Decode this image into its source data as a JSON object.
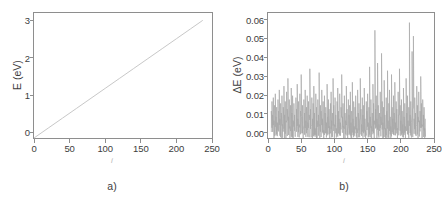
{
  "figure": {
    "caption_a": "a)",
    "caption_b": "b)",
    "line_color": "#c8c8c8",
    "spike_color": "#a8a8a8",
    "axis_color": "#8e8e8e"
  },
  "panel_a": {
    "ylabel": "E (eV)",
    "xlabel": "i",
    "caption": "a)",
    "yticks": [
      "0",
      "1",
      "2",
      "3"
    ],
    "xticks": [
      "0",
      "50",
      "100",
      "150",
      "200",
      "250"
    ]
  },
  "panel_b": {
    "ylabel": "ΔE  (eV)",
    "xlabel": "i",
    "caption": "b)",
    "yticks": [
      "0.00",
      "0.01",
      "0.02",
      "0.03",
      "0.04",
      "0.05",
      "0.06"
    ],
    "xticks": [
      "0",
      "50",
      "100",
      "150",
      "200",
      "250"
    ]
  },
  "chart_data": [
    {
      "type": "line",
      "panel": "a",
      "title": "",
      "xlabel": "i",
      "ylabel": "E (eV)",
      "xlim": [
        0,
        250
      ],
      "ylim": [
        0,
        3.4
      ],
      "xticks": [
        0,
        50,
        100,
        150,
        200,
        250
      ],
      "yticks": [
        0,
        1,
        2,
        3
      ],
      "grid": false,
      "legend": null,
      "series": [
        {
          "name": "E(i)",
          "description": "linear ramp of eigenvalue energy versus index i",
          "x": [
            0,
            20,
            40,
            60,
            80,
            100,
            120,
            140,
            160,
            180,
            200,
            220,
            237
          ],
          "y": [
            0.0,
            0.27,
            0.54,
            0.81,
            1.08,
            1.35,
            1.62,
            1.89,
            2.16,
            2.43,
            2.7,
            2.97,
            3.2
          ]
        }
      ]
    },
    {
      "type": "line",
      "panel": "b",
      "title": "",
      "xlabel": "i",
      "ylabel": "ΔE (eV)",
      "xlim": [
        0,
        250
      ],
      "ylim": [
        0,
        0.065
      ],
      "xticks": [
        0,
        50,
        100,
        150,
        200,
        250
      ],
      "yticks": [
        0.0,
        0.01,
        0.02,
        0.03,
        0.04,
        0.05,
        0.06
      ],
      "grid": false,
      "legend": null,
      "series": [
        {
          "name": "ΔE(i)",
          "description": "level spacing fluctuations versus index i, dense noisy spikes",
          "x": [
            5,
            6,
            7,
            8,
            9,
            10,
            11,
            12,
            13,
            14,
            15,
            16,
            17,
            18,
            19,
            20,
            21,
            22,
            23,
            24,
            25,
            26,
            27,
            28,
            29,
            30,
            31,
            32,
            33,
            34,
            35,
            36,
            37,
            38,
            39,
            40,
            41,
            42,
            43,
            44,
            45,
            46,
            47,
            48,
            49,
            50,
            51,
            52,
            53,
            54,
            55,
            56,
            57,
            58,
            59,
            60,
            61,
            62,
            63,
            64,
            65,
            66,
            67,
            68,
            69,
            70,
            71,
            72,
            73,
            74,
            75,
            76,
            77,
            78,
            79,
            80,
            81,
            82,
            83,
            84,
            85,
            86,
            87,
            88,
            89,
            90,
            91,
            92,
            93,
            94,
            95,
            96,
            97,
            98,
            99,
            100,
            101,
            102,
            103,
            104,
            105,
            106,
            107,
            108,
            109,
            110,
            111,
            112,
            113,
            114,
            115,
            116,
            117,
            118,
            119,
            120,
            121,
            122,
            123,
            124,
            125,
            126,
            127,
            128,
            129,
            130,
            131,
            132,
            133,
            134,
            135,
            136,
            137,
            138,
            139,
            140,
            141,
            142,
            143,
            144,
            145,
            146,
            147,
            148,
            149,
            150,
            151,
            152,
            153,
            154,
            155,
            156,
            157,
            158,
            159,
            160,
            161,
            162,
            163,
            164,
            165,
            166,
            167,
            168,
            169,
            170,
            171,
            172,
            173,
            174,
            175,
            176,
            177,
            178,
            179,
            180,
            181,
            182,
            183,
            184,
            185,
            186,
            187,
            188,
            189,
            190,
            191,
            192,
            193,
            194,
            195,
            196,
            197,
            198,
            199,
            200,
            201,
            202,
            203,
            204,
            205,
            206,
            207,
            208,
            209,
            210,
            211,
            212,
            213,
            214,
            215,
            216,
            217,
            218,
            219,
            220,
            221,
            222,
            223,
            224,
            225,
            226,
            227,
            228,
            229,
            230,
            231,
            232,
            233,
            234,
            235,
            236,
            237,
            238,
            239,
            240
          ],
          "y": [
            0.014,
            0.019,
            0.012,
            0.021,
            0.009,
            0.017,
            0.023,
            0.011,
            0.016,
            0.008,
            0.02,
            0.014,
            0.025,
            0.01,
            0.018,
            0.013,
            0.022,
            0.007,
            0.016,
            0.027,
            0.012,
            0.019,
            0.009,
            0.024,
            0.015,
            0.031,
            0.011,
            0.02,
            0.006,
            0.017,
            0.026,
            0.013,
            0.022,
            0.009,
            0.018,
            0.012,
            0.005,
            0.021,
            0.015,
            0.028,
            0.01,
            0.019,
            0.007,
            0.023,
            0.014,
            0.033,
            0.011,
            0.017,
            0.004,
            0.02,
            0.013,
            0.025,
            0.009,
            0.016,
            0.022,
            0.008,
            0.019,
            0.012,
            0.036,
            0.015,
            0.006,
            0.021,
            0.01,
            0.018,
            0.027,
            0.013,
            0.005,
            0.023,
            0.016,
            0.009,
            0.02,
            0.012,
            0.034,
            0.007,
            0.017,
            0.014,
            0.025,
            0.01,
            0.019,
            0.004,
            0.022,
            0.013,
            0.016,
            0.008,
            0.028,
            0.011,
            0.02,
            0.015,
            0.006,
            0.018,
            0.024,
            0.009,
            0.013,
            0.031,
            0.017,
            0.007,
            0.021,
            0.012,
            0.005,
            0.019,
            0.026,
            0.014,
            0.01,
            0.023,
            0.008,
            0.016,
            0.033,
            0.011,
            0.018,
            0.006,
            0.022,
            0.013,
            0.009,
            0.027,
            0.015,
            0.004,
            0.02,
            0.012,
            0.017,
            0.024,
            0.008,
            0.014,
            0.029,
            0.01,
            0.019,
            0.006,
            0.016,
            0.022,
            0.011,
            0.005,
            0.025,
            0.013,
            0.018,
            0.009,
            0.031,
            0.015,
            0.007,
            0.021,
            0.012,
            0.017,
            0.026,
            0.01,
            0.004,
            0.019,
            0.014,
            0.023,
            0.008,
            0.016,
            0.037,
            0.011,
            0.02,
            0.006,
            0.013,
            0.028,
            0.018,
            0.009,
            0.056,
            0.015,
            0.022,
            0.01,
            0.039,
            0.017,
            0.007,
            0.013,
            0.024,
            0.011,
            0.044,
            0.019,
            0.008,
            0.016,
            0.03,
            0.012,
            0.005,
            0.021,
            0.014,
            0.035,
            0.009,
            0.018,
            0.025,
            0.011,
            0.006,
            0.033,
            0.016,
            0.01,
            0.022,
            0.013,
            0.029,
            0.008,
            0.019,
            0.015,
            0.005,
            0.024,
            0.012,
            0.036,
            0.017,
            0.009,
            0.02,
            0.014,
            0.007,
            0.026,
            0.011,
            0.018,
            0.006,
            0.031,
            0.013,
            0.022,
            0.009,
            0.016,
            0.06,
            0.012,
            0.019,
            0.008,
            0.045,
            0.015,
            0.053,
            0.01,
            0.021,
            0.013,
            0.006,
            0.027,
            0.017,
            0.011,
            0.024,
            0.009,
            0.014,
            0.032,
            0.018,
            0.007,
            0.02,
            0.012,
            0.016,
            0.005,
            0.01
          ]
        }
      ]
    }
  ]
}
